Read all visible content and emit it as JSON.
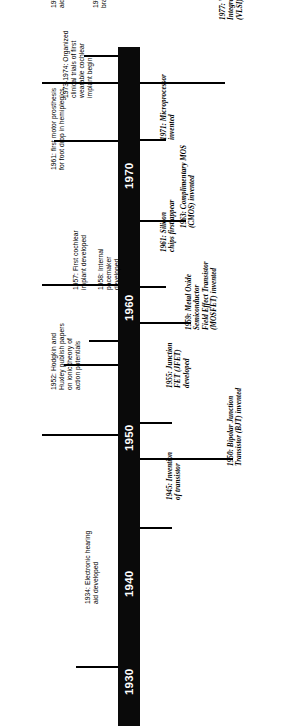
{
  "figure": {
    "type": "timeline",
    "orientation": "vertical-rotated",
    "axis_color": "#0a0a0a",
    "text_color": "#000000",
    "background": "#ffffff"
  },
  "axis": {
    "decades": [
      {
        "label": "1930",
        "y": 684
      },
      {
        "label": "1940",
        "y": 586
      },
      {
        "label": "1950",
        "y": 440
      },
      {
        "label": "1960",
        "y": 310
      },
      {
        "label": "1970",
        "y": 178
      }
    ]
  },
  "events_medical": [
    {
      "year": "1979",
      "text": "First auditory brainstem implant",
      "lines": [
        "1979: First auditory",
        "brainstem implant"
      ],
      "tick_y": 55,
      "label_x": 92,
      "label_y": 8
    },
    {
      "year": "1977",
      "text": "Bone-anchored hearing aid made available in Europe",
      "lines": [
        "1977: Bone-anchored hearing",
        "aid made available in Europe"
      ],
      "tick_y": 82,
      "label_x": 50,
      "label_y": 8
    },
    {
      "year": "1973-1974",
      "text": "Organized clinical trials of first wearable cochlear implant begin",
      "lines": [
        "1973-1974: Organized",
        "clinical trials of first",
        "wearable cochlear",
        "implant begin"
      ],
      "tick_y": 140,
      "label_x": 62,
      "label_y": 98
    },
    {
      "year": "1961",
      "text": "first motor prosthesis for foot drop in hemiplegics",
      "lines": [
        "1961: first motor prosthesis",
        "for foot drop in hemiplegics"
      ],
      "tick_y": 284,
      "label_x": 50,
      "label_y": 170
    },
    {
      "year": "1958",
      "text": "Internal pacemaker developed",
      "lines": [
        "1958: Internal",
        "pacemaker",
        "developed"
      ],
      "tick_y": 340,
      "label_x": 97,
      "label_y": 290
    },
    {
      "year": "1957",
      "text": "First cochlear implant developed",
      "lines": [
        "1957: First cochlear",
        "implant developed"
      ],
      "tick_y": 364,
      "label_x": 72,
      "label_y": 290
    },
    {
      "year": "1952",
      "text": "Hodgkin and Huxley publish papers on ionic theory of action potentials",
      "lines": [
        "1952: Hodgkin and",
        "Huxley publish papers",
        "on ionic theory of",
        "action potentials"
      ],
      "tick_y": 434,
      "label_x": 50,
      "label_y": 390
    },
    {
      "year": "1934",
      "text": "Electronic hearing aid developed",
      "lines": [
        "1934: Electronic hearing",
        "aid developed"
      ],
      "tick_y": 666,
      "label_x": 84,
      "label_y": 604
    }
  ],
  "events_electronics": [
    {
      "year": "1977",
      "text": "Very Large Scale Integrated Circuit (VLSI) developed",
      "lines": [
        "1977: Very Large Scale",
        "Integrated Circuit",
        "(VLSI) developed"
      ],
      "tick_y": 82,
      "label_x": 219,
      "label_y": 20
    },
    {
      "year": "1971",
      "text": "Microprocessor invented",
      "lines": [
        "1971: Microprocessor",
        "invented"
      ],
      "tick_y": 139,
      "label_x": 160,
      "label_y": 140
    },
    {
      "year": "1963",
      "text": "Complimentary MOS (CMOS) invented",
      "lines": [
        "1963: Complimentary MOS",
        "(CMOS) invented"
      ],
      "tick_y": 220,
      "label_x": 180,
      "label_y": 228
    },
    {
      "year": "1961",
      "text": "Silicon chips first appear",
      "lines": [
        "1961: Silicon",
        "chips first appear"
      ],
      "tick_y": 286,
      "label_x": 160,
      "label_y": 252
    },
    {
      "year": "1959",
      "text": "Metal Oxide Semiconductor Field Effect Transistor (MOSFET) invented",
      "lines": [
        "1959: Metal Oxide",
        "Semiconductor",
        "Field Effect Transistor",
        "(MOSFET) invented"
      ],
      "tick_y": 322,
      "label_x": 185,
      "label_y": 330
    },
    {
      "year": "1955",
      "text": "Junction FET (JFET) developed",
      "lines": [
        "1955: Junction",
        "FET (JFET)",
        "developed"
      ],
      "tick_y": 422,
      "label_x": 166,
      "label_y": 388
    },
    {
      "year": "1950",
      "text": "Bipolar Junction Transistor (BJT) invented",
      "lines": [
        "1950: Bipolar Junction",
        "Transistor (BJT) invented"
      ],
      "tick_y": 458,
      "label_x": 227,
      "label_y": 466
    },
    {
      "year": "1945",
      "text": "Invention of transistor",
      "lines": [
        "1945: Invention",
        "of transistor"
      ],
      "tick_y": 527,
      "label_x": 166,
      "label_y": 500
    }
  ]
}
